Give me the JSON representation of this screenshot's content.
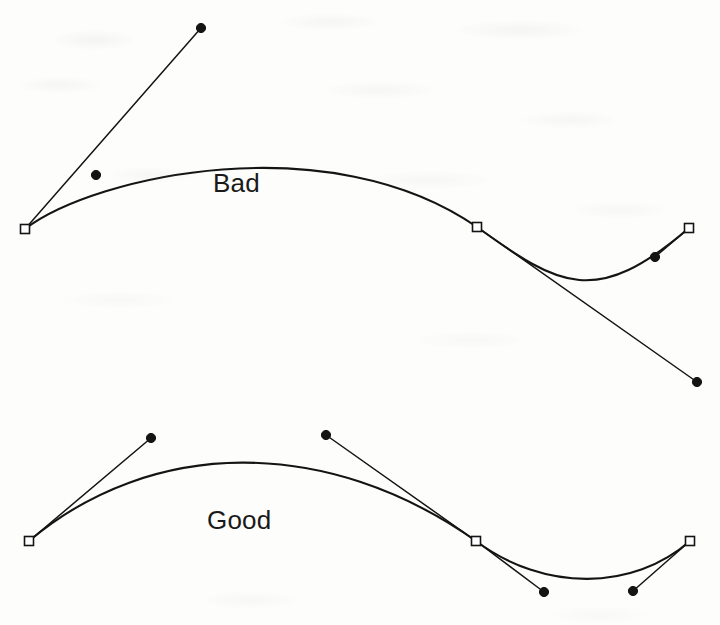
{
  "figure": {
    "background_color": "#fdfdfb",
    "ink_color": "#141414",
    "labels": {
      "bad": "Bad",
      "good": "Good"
    }
  },
  "chart_data": {
    "type": "line",
    "xlabel": "",
    "ylabel": "",
    "grid": false,
    "legend": "none",
    "xlim": [
      0,
      720
    ],
    "ylim": [
      625,
      0
    ],
    "annotations": [
      {
        "text": "Bad",
        "x": 213,
        "y": 192
      },
      {
        "text": "Good",
        "x": 207,
        "y": 529
      }
    ],
    "series": [
      {
        "name": "Bad curve",
        "type": "bezier",
        "marker_anchor": "open-square",
        "marker_control": "filled-circle",
        "anchors": [
          {
            "x": 25,
            "y": 229
          },
          {
            "x": 477,
            "y": 227
          },
          {
            "x": 689,
            "y": 228
          }
        ],
        "control_points": [
          {
            "x": 201,
            "y": 28,
            "attached_to_anchor": 0,
            "handle_from": {
              "x": 25,
              "y": 229
            }
          },
          {
            "x": 96,
            "y": 175,
            "attached_to_anchor": 0,
            "handle_from": {
              "x": 25,
              "y": 229
            }
          },
          {
            "x": 697,
            "y": 382,
            "attached_to_anchor": 1,
            "handle_from": {
              "x": 477,
              "y": 227
            }
          },
          {
            "x": 655,
            "y": 257,
            "attached_to_anchor": 2,
            "handle_from": {
              "x": 689,
              "y": 228
            }
          }
        ],
        "segments": [
          {
            "p0": {
              "x": 25,
              "y": 229
            },
            "c1": {
              "x": 96,
              "y": 175
            },
            "c2": {
              "x": 330,
              "y": 125
            },
            "p1": {
              "x": 477,
              "y": 227
            }
          },
          {
            "p0": {
              "x": 477,
              "y": 227
            },
            "c1": {
              "x": 560,
              "y": 287
            },
            "c2": {
              "x": 596,
              "y": 308
            },
            "p1": {
              "x": 689,
              "y": 228
            }
          }
        ],
        "handle_lines": [
          {
            "from": {
              "x": 25,
              "y": 229
            },
            "to": {
              "x": 201,
              "y": 28
            }
          },
          {
            "from": {
              "x": 477,
              "y": 227
            },
            "to": {
              "x": 697,
              "y": 382
            }
          },
          {
            "from": {
              "x": 689,
              "y": 228
            },
            "to": {
              "x": 655,
              "y": 257
            }
          }
        ],
        "notes": "Control handles overshoot far beyond the curve; handles are too long and unbalanced."
      },
      {
        "name": "Good curve",
        "type": "bezier",
        "marker_anchor": "open-square",
        "marker_control": "filled-circle",
        "anchors": [
          {
            "x": 29,
            "y": 541
          },
          {
            "x": 476,
            "y": 541
          },
          {
            "x": 690,
            "y": 541
          }
        ],
        "control_points": [
          {
            "x": 151,
            "y": 438,
            "attached_to_anchor": 0,
            "handle_from": {
              "x": 29,
              "y": 541
            }
          },
          {
            "x": 326,
            "y": 435,
            "attached_to_anchor": 1,
            "handle_from": {
              "x": 476,
              "y": 541
            }
          },
          {
            "x": 544,
            "y": 592,
            "attached_to_anchor": 1,
            "handle_from": {
              "x": 476,
              "y": 541
            }
          },
          {
            "x": 633,
            "y": 591,
            "attached_to_anchor": 2,
            "handle_from": {
              "x": 690,
              "y": 541
            }
          }
        ],
        "segments": [
          {
            "p0": {
              "x": 29,
              "y": 541
            },
            "c1": {
              "x": 151,
              "y": 438
            },
            "c2": {
              "x": 326,
              "y": 435
            },
            "p1": {
              "x": 476,
              "y": 541
            }
          },
          {
            "p0": {
              "x": 476,
              "y": 541
            },
            "c1": {
              "x": 544,
              "y": 592
            },
            "c2": {
              "x": 633,
              "y": 591
            },
            "p1": {
              "x": 690,
              "y": 541
            }
          }
        ],
        "handle_lines": [
          {
            "from": {
              "x": 29,
              "y": 541
            },
            "to": {
              "x": 151,
              "y": 438
            }
          },
          {
            "from": {
              "x": 476,
              "y": 541
            },
            "to": {
              "x": 326,
              "y": 435
            }
          },
          {
            "from": {
              "x": 476,
              "y": 541
            },
            "to": {
              "x": 544,
              "y": 592
            }
          },
          {
            "from": {
              "x": 690,
              "y": 541
            },
            "to": {
              "x": 633,
              "y": 591
            }
          }
        ],
        "notes": "Control handles are short, symmetric and hug the curve, giving a smooth shape."
      }
    ]
  }
}
